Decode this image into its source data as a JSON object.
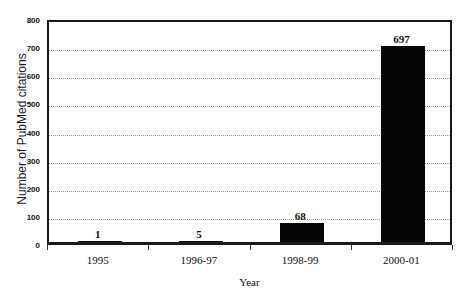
{
  "chart_data": {
    "type": "bar",
    "title": "",
    "categories": [
      "1995",
      "1996-97",
      "1998-99",
      "2000-01"
    ],
    "values": [
      1,
      5,
      68,
      697
    ],
    "value_labels": [
      "1",
      "5",
      "68",
      "697"
    ],
    "xlabel": "Year",
    "ylabel": "Number of PubMed citations",
    "ylim": [
      0,
      800
    ],
    "yticks": [
      0,
      100,
      200,
      300,
      400,
      500,
      600,
      700,
      800
    ],
    "ytick_labels": [
      "0",
      "100",
      "200",
      "300",
      "400",
      "500",
      "600",
      "700",
      "800"
    ],
    "grid": true,
    "grid_axis": "y",
    "grid_style": "dotted",
    "legend": "none",
    "bar_color": "#050505",
    "background_color": "#ffffff",
    "axis_color": "#1a1a1a",
    "gridline_color": "#9a9a9a"
  }
}
